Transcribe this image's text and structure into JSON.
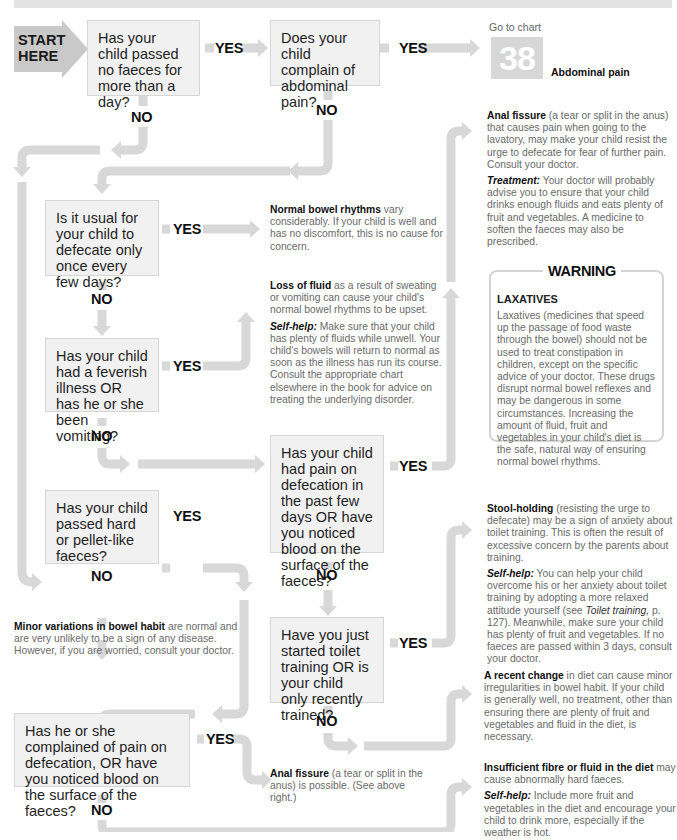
{
  "start": {
    "line1": "START",
    "line2": "HERE"
  },
  "labels": {
    "yes": "YES",
    "no": "NO"
  },
  "questions": {
    "q1": "Has your child passed no faeces for more than a day?",
    "q2": "Does your child complain of abdominal pain?",
    "q3": "Is it usual for your child to defecate only once every few days?",
    "q4": "Has your child had a feverish illness OR has he or she been vomiting?",
    "q5": "Has your child had pain on defecation in the past few days OR have you noticed blood on the surface of the faeces?",
    "q6": "Has your child passed hard or pellet-like faeces?",
    "q7": "Have you just started toilet training OR is your child only recently trained?",
    "q8": "Has he or she complained of pain on defecation, OR have you noticed blood on the surface of the faeces?"
  },
  "goto": {
    "prefix": "Go to chart",
    "number": "38",
    "title": "Abdominal pain"
  },
  "outcomes": {
    "anal_fissure": {
      "title": "Anal fissure",
      "text": " (a tear or split in the anus) that causes pain when going to the lavatory, may make your child resist the urge to defecate for fear of further pain. Consult your doctor.",
      "sub_label": "Treatment:",
      "sub_text": " Your doctor will probably advise you to ensure that your child drinks enough fluids and eats plenty of fruit and vegetables. A medicine to soften the faeces may also be prescribed."
    },
    "normal_rhythms": {
      "title": "Normal bowel rhythms",
      "text": " vary considerably. If your child is well and has no discomfort, this is no cause for concern."
    },
    "loss_of_fluid": {
      "title": "Loss of fluid",
      "text": " as a result of sweating or vomiting can cause your child's normal bowel rhythms to be upset.",
      "sub_label": "Self-help:",
      "sub_text": " Make sure that your child has plenty of fluids while unwell. Your child's bowels will return to normal as soon as the illness has run its course. Consult the appropriate chart elsewhere in the book for advice on treating the underlying disorder."
    },
    "stool_holding": {
      "title": "Stool-holding",
      "text": " (resisting the urge to defecate) may be a sign of anxiety about toilet training. This is often the result of excessive concern by the parents about training.",
      "sub_label": "Self-help:",
      "sub_text_1": " You can help your child overcome his or her anxiety about toilet training by adopting a more relaxed attitude yourself (see ",
      "sub_ref": "Toilet training,",
      "sub_text_2": " p. 127). Meanwhile, make sure your child has plenty of fruit and vegetables. If no faeces are passed within 3 days, consult your doctor."
    },
    "minor_variations": {
      "title": "Minor variations in bowel habit",
      "text": " are normal and are very unlikely to be a sign of any disease. However, if you are worried, consult your doctor."
    },
    "recent_change": {
      "title": "A recent change",
      "text": " in diet can cause minor irregularities in bowel habit. If your child is generally well, no treatment, other than ensuring there are plenty of fruit and vegetables and fluid in the diet, is necessary."
    },
    "anal_fissure_possible": {
      "title": "Anal fissure",
      "text": " (a tear or split in the anus) is possible. (See above right.)"
    },
    "insufficient_fibre": {
      "title": "Insufficient fibre or fluid in the diet",
      "text": " may cause abnormally hard faeces.",
      "sub_label": "Self-help:",
      "sub_text": " Include more fruit and vegetables in the diet and encourage your child to drink more, especially if the weather is hot."
    }
  },
  "warning": {
    "title": "WARNING",
    "heading": "LAXATIVES",
    "text": "Laxatives (medicines that speed up the passage of food waste through the bowel) should not be used to treat constipation in children, except on the specific advice of your doctor. These drugs disrupt normal bowel reflexes and may be dangerous in some circumstances. Increasing the amount of fluid, fruit and vegetables in your child's diet is the safe, natural way of ensuring normal bowel rhythms."
  },
  "colors": {
    "arrow": "#d8d8d8",
    "box_fill": "#f1f1f1",
    "box_border": "#d6d6d6",
    "chart_badge": "#d7d7d7"
  }
}
